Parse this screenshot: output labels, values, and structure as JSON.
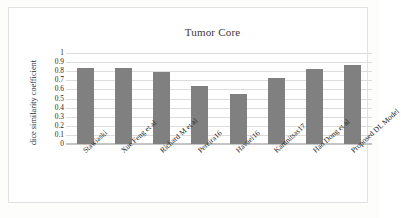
{
  "chart_data": {
    "type": "bar",
    "title": "Tumor Core",
    "xlabel": "",
    "ylabel": "dice similarity coefficient",
    "categories": [
      "Stawiaski",
      "Xue Feng et al",
      "Richard M et al",
      "Pereira16",
      "Havaei16",
      "Kamnitsas17",
      "Hao Dong et al",
      "Proposed DL Model"
    ],
    "values": [
      0.84,
      0.83,
      0.79,
      0.64,
      0.55,
      0.73,
      0.82,
      0.87
    ],
    "ylim": [
      0,
      1
    ],
    "ytick_labels": [
      "1",
      "0.9",
      "0.8",
      "0.7",
      "0.6",
      "0.5",
      "0.4",
      "0.3",
      "0.2",
      "0.1",
      "0"
    ],
    "ytick_values": [
      1,
      0.9,
      0.8,
      0.7,
      0.6,
      0.5,
      0.4,
      0.3,
      0.2,
      0.1,
      0
    ],
    "grid": true,
    "legend": false,
    "legend_position": "none",
    "bar_color": "#808080",
    "gridline_color": "#dcdcdc",
    "frame_border_color": "#e2e2e2",
    "background_color": "#ffffff"
  }
}
